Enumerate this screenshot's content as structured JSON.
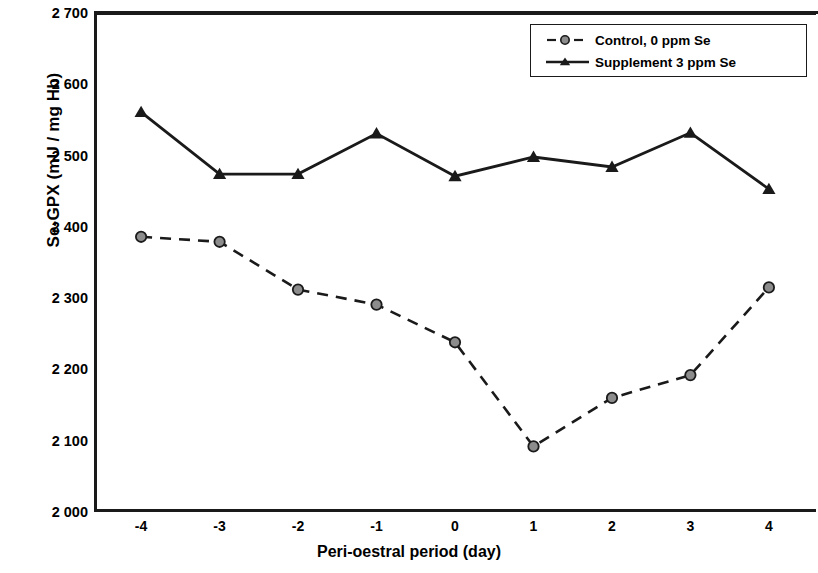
{
  "chart_data": {
    "type": "line",
    "title": "",
    "xlabel": "Peri-oestral period (day)",
    "ylabel": "Se-GPX (mU / mg Hb)",
    "x": [
      -4,
      -3,
      -2,
      -1,
      0,
      1,
      2,
      3,
      4
    ],
    "xtick_labels": [
      "-4",
      "-3",
      "-2",
      "-1",
      "0",
      "1",
      "2",
      "3",
      "4"
    ],
    "ytick_labels": [
      "2 000",
      "2 100",
      "2 200",
      "2 300",
      "2 400",
      "2 500",
      "2 600",
      "2 700"
    ],
    "ytick_values": [
      2000,
      2100,
      2200,
      2300,
      2400,
      2500,
      2600,
      2700
    ],
    "ylim": [
      2000,
      2700
    ],
    "xlim": [
      -4.6,
      4.6
    ],
    "grid": false,
    "legend_position": "top-right",
    "series": [
      {
        "name": "Control, 0 ppm Se",
        "marker": "circle",
        "line_style": "dashed",
        "color": "#1a1a1a",
        "marker_fill": "#8c8c8c",
        "values": [
          2386,
          2379,
          2312,
          2291,
          2238,
          2092,
          2160,
          2192,
          2315
        ]
      },
      {
        "name": "Supplement 3 ppm Se",
        "marker": "triangle",
        "line_style": "solid",
        "color": "#1a1a1a",
        "marker_fill": "#1a1a1a",
        "values": [
          2561,
          2474,
          2474,
          2531,
          2471,
          2498,
          2484,
          2532,
          2453
        ]
      }
    ]
  },
  "legend": {
    "items": [
      {
        "label": "Control, 0 ppm Se"
      },
      {
        "label": "Supplement 3 ppm Se"
      }
    ]
  },
  "axes": {
    "x_title": "Peri-oestral period (day)",
    "y_title": "Se-GPX (mU / mg Hb)"
  }
}
